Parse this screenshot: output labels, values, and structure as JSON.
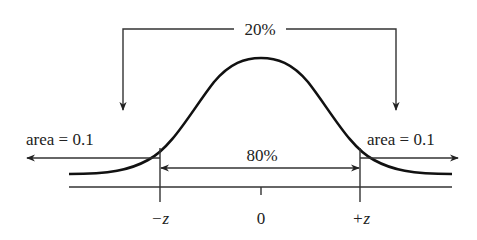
{
  "diagram": {
    "top_label": "20%",
    "center_label": "80%",
    "left_tail_label": "area = 0.1",
    "right_tail_label": "area = 0.1",
    "axis_ticks": {
      "left": "−z",
      "center": "0",
      "right": "+z"
    },
    "colors": {
      "ink": "#222222",
      "background": "#ffffff"
    }
  }
}
